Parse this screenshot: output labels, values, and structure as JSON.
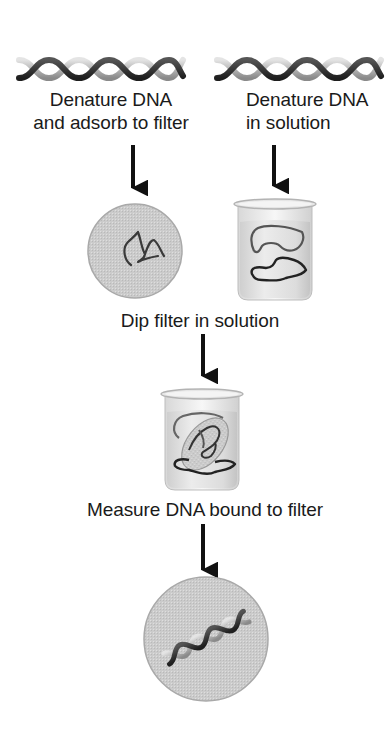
{
  "diagram": {
    "type": "process-flowchart",
    "colors": {
      "background": "#ffffff",
      "text": "#1a1a1a",
      "arrow": "#111111",
      "filter_fill": "#cfcfcf",
      "filter_edge": "#a8a8a8",
      "beaker_liquid": "#e2e2e2",
      "strand_dark": "#2a2a2a",
      "strand_mid": "#6a6a6a"
    },
    "steps": {
      "left_start": {
        "icon": "dna-double-helix",
        "label_line1": "Denature DNA",
        "label_line2": "and adsorb to filter",
        "result_icon": "filter-disc-with-single-strand-dna"
      },
      "right_start": {
        "icon": "dna-double-helix",
        "label_line1": "Denature DNA",
        "label_line2": "in solution",
        "result_icon": "beaker-with-single-strand-dna"
      },
      "dip": {
        "label": "Dip filter in solution",
        "result_icon": "beaker-with-filter-and-dna"
      },
      "measure": {
        "label": "Measure DNA bound to filter",
        "result_icon": "filter-disc-with-double-helix"
      }
    },
    "edges": [
      {
        "from": "left-dna-helix",
        "to": "filter-disc-single-strand"
      },
      {
        "from": "right-dna-helix",
        "to": "beaker-single-strand"
      },
      {
        "from": "dip-label",
        "to": "beaker-with-filter"
      },
      {
        "from": "measure-label",
        "to": "filter-disc-hybridized"
      }
    ]
  }
}
